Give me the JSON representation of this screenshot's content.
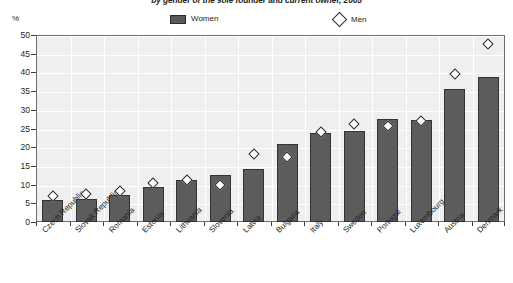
{
  "chart_data": {
    "type": "bar",
    "title": "by gender of the sole founder and current owner, 2005",
    "xlabel": "",
    "ylabel": "%",
    "ylim": [
      0,
      50
    ],
    "yticks": [
      0,
      5,
      10,
      15,
      20,
      25,
      30,
      35,
      40,
      45,
      50
    ],
    "grid": true,
    "legend_position": "top-center",
    "categories": [
      "Czech Republic",
      "Slovak Republic",
      "Romania",
      "Estonia",
      "Lithuania",
      "Slovenia",
      "Latvia",
      "Bulgaria",
      "Italy",
      "Sweden",
      "Portugal",
      "Luxembourg",
      "Austria",
      "Denmark"
    ],
    "series": [
      {
        "name": "Women",
        "marker": "bar",
        "color": "#5c5c5c",
        "values": [
          5.8,
          6.1,
          7.1,
          9.3,
          11.1,
          12.7,
          14.2,
          20.8,
          23.8,
          24.4,
          27.5,
          27.4,
          35.5,
          38.8
        ]
      },
      {
        "name": "Men",
        "marker": "diamond",
        "color": "#ffffff",
        "values": [
          7.0,
          7.5,
          8.2,
          10.3,
          11.1,
          10.0,
          18.3,
          17.3,
          24.0,
          26.3,
          25.8,
          27.0,
          39.5,
          47.5
        ]
      }
    ]
  },
  "legend": {
    "women_label": "Women",
    "men_label": "Men"
  },
  "axis": {
    "y_unit": "%"
  }
}
